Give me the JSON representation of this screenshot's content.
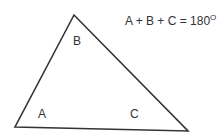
{
  "diagram": {
    "type": "triangle",
    "stroke_color": "#333333",
    "vertices": {
      "top": [
        74,
        15
      ],
      "bottom_left": [
        15,
        127
      ],
      "bottom_right": [
        188,
        131
      ]
    },
    "angle_labels": {
      "A": "A",
      "B": "B",
      "C": "C"
    },
    "equation": {
      "text": "A + B + C = 180",
      "superscript": "O"
    }
  }
}
